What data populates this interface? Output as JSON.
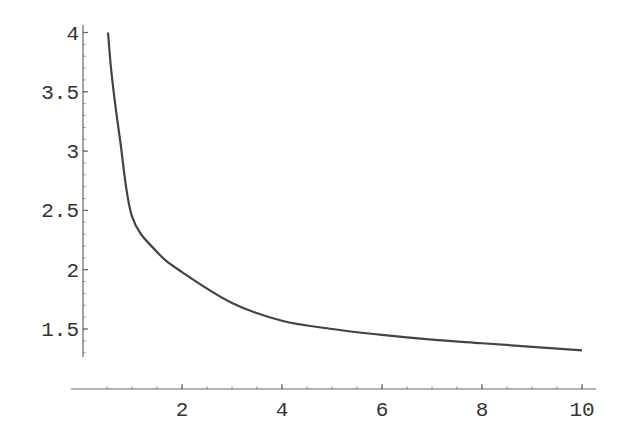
{
  "chart_data": {
    "type": "line",
    "title": "",
    "xlabel": "",
    "ylabel": "",
    "xlim": [
      0,
      10
    ],
    "ylim": [
      1.25,
      4.05
    ],
    "grid": false,
    "legend": null,
    "x_ticks": [
      2,
      4,
      6,
      8,
      10
    ],
    "x_tick_labels": [
      "2",
      "4",
      "6",
      "8",
      "10"
    ],
    "y_ticks": [
      1.5,
      2,
      2.5,
      3,
      3.5,
      4
    ],
    "y_tick_labels": [
      "1.5",
      "2",
      "2.5",
      "3",
      "3.5",
      "4"
    ],
    "series": [
      {
        "name": "curve",
        "color": "#444444",
        "x": [
          0.52,
          0.6,
          0.76,
          1.0,
          1.5,
          2.0,
          3.0,
          4.0,
          5.0,
          6.0,
          7.0,
          8.0,
          9.0,
          10.0
        ],
        "y": [
          4.0,
          3.62,
          3.1,
          2.45,
          2.15,
          1.98,
          1.72,
          1.57,
          1.5,
          1.45,
          1.41,
          1.38,
          1.35,
          1.32
        ]
      }
    ]
  }
}
